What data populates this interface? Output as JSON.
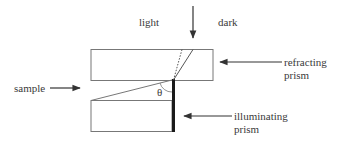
{
  "diagram": {
    "title": "",
    "labels": {
      "light": "light",
      "dark": "dark",
      "sample": "sample",
      "refracting_line1": "refracting",
      "refracting_line2": "prism",
      "illuminating_line1": "illuminating",
      "illuminating_line2": "prism",
      "angle": "θ"
    },
    "components": [
      {
        "id": "refracting-prism",
        "shape": "rectangle",
        "x": 91,
        "y": 49,
        "w": 122,
        "h": 31
      },
      {
        "id": "illuminating-prism",
        "shape": "rectangle",
        "x": 91,
        "y": 100,
        "w": 81,
        "h": 31
      },
      {
        "id": "sample-layer",
        "shape": "wedge",
        "from": [
          91,
          100
        ],
        "to": [
          172,
          80
        ]
      },
      {
        "id": "illuminating-face",
        "shape": "thick-bar",
        "x": 172,
        "y": 79,
        "w": 3,
        "h": 52
      }
    ],
    "rays": [
      {
        "id": "incident-ray",
        "from": [
          193,
          49
        ],
        "to": [
          173,
          80
        ],
        "style": "solid"
      },
      {
        "id": "critical-ray",
        "from": [
          182,
          49
        ],
        "to": [
          173,
          80
        ],
        "style": "dotted"
      }
    ],
    "arrows": [
      {
        "id": "light-arrow",
        "direction": "down",
        "from": [
          193,
          6
        ],
        "to": [
          193,
          38
        ]
      },
      {
        "id": "sample-arrow",
        "direction": "right",
        "from": [
          50,
          88
        ],
        "to": [
          80,
          88
        ]
      },
      {
        "id": "refracting-arrow",
        "direction": "left",
        "from": [
          282,
          62
        ],
        "to": [
          220,
          62
        ]
      },
      {
        "id": "illuminating-arrow",
        "direction": "left",
        "from": [
          232,
          116
        ],
        "to": [
          184,
          116
        ]
      }
    ],
    "colors": {
      "line": "#555555",
      "bar": "#1a1a1a",
      "text": "#3a3a3a"
    }
  }
}
